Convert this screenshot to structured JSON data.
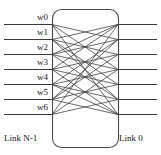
{
  "figure": {
    "type": "network-switch-diagram",
    "background_color": "#ffffff",
    "line_color": "#3a3a3a",
    "box_stroke_color": "#4a4a4a",
    "text_color": "#1a1a1a"
  },
  "channels": {
    "count": 7,
    "labels": [
      "w0",
      "w1",
      "w2",
      "w3",
      "w4",
      "w5",
      "w6"
    ],
    "y_positions": [
      24,
      39,
      54,
      69,
      84,
      99,
      114
    ],
    "label_x_right": 48
  },
  "ports": {
    "left_x": 52,
    "right_x": 118,
    "left_line_start_x": 4,
    "right_line_end_x": 157
  },
  "box": {
    "x": 52,
    "y": 9,
    "width": 66,
    "height": 138,
    "corner_radius": 9
  },
  "link_labels": {
    "left": "Link N-1",
    "right": "Link 0"
  },
  "crossbar_connections": [
    {
      "from": 0,
      "to": 3
    },
    {
      "from": 0,
      "to": 6
    },
    {
      "from": 1,
      "to": 0
    },
    {
      "from": 1,
      "to": 2
    },
    {
      "from": 1,
      "to": 4
    },
    {
      "from": 2,
      "to": 1
    },
    {
      "from": 2,
      "to": 3
    },
    {
      "from": 2,
      "to": 5
    },
    {
      "from": 3,
      "to": 0
    },
    {
      "from": 3,
      "to": 2
    },
    {
      "from": 3,
      "to": 4
    },
    {
      "from": 3,
      "to": 6
    },
    {
      "from": 4,
      "to": 1
    },
    {
      "from": 4,
      "to": 3
    },
    {
      "from": 4,
      "to": 5
    },
    {
      "from": 5,
      "to": 2
    },
    {
      "from": 5,
      "to": 4
    },
    {
      "from": 5,
      "to": 6
    },
    {
      "from": 6,
      "to": 0
    },
    {
      "from": 6,
      "to": 3
    },
    {
      "from": 0,
      "to": 1
    },
    {
      "from": 2,
      "to": 0
    },
    {
      "from": 4,
      "to": 6
    },
    {
      "from": 6,
      "to": 5
    },
    {
      "from": 1,
      "to": 5
    },
    {
      "from": 5,
      "to": 1
    }
  ]
}
